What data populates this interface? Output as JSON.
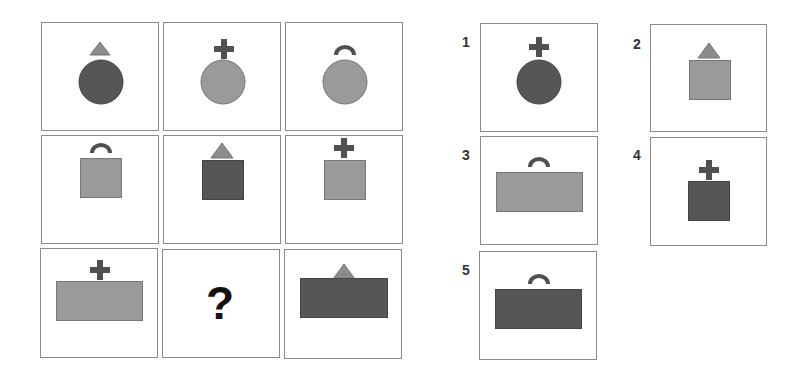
{
  "colors": {
    "dark": "#565656",
    "light": "#9a9a9a",
    "accent_dark": "#505050",
    "accent_light": "#8c8c8c",
    "border": "#8a8a8a"
  },
  "matrix": {
    "question_mark": "?",
    "cells": [
      {
        "row": 1,
        "col": 1,
        "base": "circle",
        "base_color": "dark",
        "top": "triangle"
      },
      {
        "row": 1,
        "col": 2,
        "base": "circle",
        "base_color": "light",
        "top": "cross"
      },
      {
        "row": 1,
        "col": 3,
        "base": "circle",
        "base_color": "light",
        "top": "arc"
      },
      {
        "row": 2,
        "col": 1,
        "base": "square",
        "base_color": "light",
        "top": "arc"
      },
      {
        "row": 2,
        "col": 2,
        "base": "square",
        "base_color": "dark",
        "top": "triangle"
      },
      {
        "row": 2,
        "col": 3,
        "base": "square",
        "base_color": "light",
        "top": "cross"
      },
      {
        "row": 3,
        "col": 1,
        "base": "rectangle",
        "base_color": "light",
        "top": "cross"
      },
      {
        "row": 3,
        "col": 2,
        "base": "missing",
        "base_color": "",
        "top": ""
      },
      {
        "row": 3,
        "col": 3,
        "base": "rectangle",
        "base_color": "dark",
        "top": "triangle"
      }
    ]
  },
  "options": [
    {
      "label": "1",
      "base": "circle",
      "base_color": "dark",
      "top": "cross"
    },
    {
      "label": "2",
      "base": "square",
      "base_color": "light",
      "top": "triangle"
    },
    {
      "label": "3",
      "base": "rectangle",
      "base_color": "light",
      "top": "arc"
    },
    {
      "label": "4",
      "base": "square",
      "base_color": "dark",
      "top": "cross"
    },
    {
      "label": "5",
      "base": "rectangle",
      "base_color": "dark",
      "top": "arc"
    }
  ]
}
